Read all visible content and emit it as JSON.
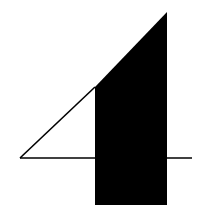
{
  "figure": {
    "colors": {
      "background": "#ffffff",
      "fill": "#000000",
      "stroke": "#000000"
    },
    "triangle_outline": {
      "points": [
        [
          20,
          158
        ],
        [
          95,
          87
        ],
        [
          95,
          158
        ]
      ],
      "stroke_width": 1.6
    },
    "filled_shape": {
      "points": [
        [
          95,
          87
        ],
        [
          167,
          12
        ],
        [
          167,
          205
        ],
        [
          95,
          205
        ]
      ]
    },
    "horizontal_line": {
      "x1": 20,
      "y1": 158,
      "x2": 192,
      "y2": 158,
      "stroke_width": 1.6
    }
  }
}
